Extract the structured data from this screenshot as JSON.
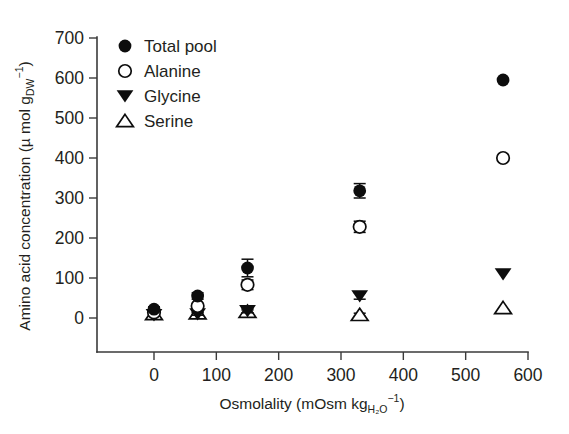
{
  "figure": {
    "title": "",
    "background": "#ffffff",
    "marker_color": "#0d0d0d",
    "axis_color": "#3a3a3a"
  },
  "axes": {
    "y": {
      "label_parts": {
        "main": "Amino acid concentration (µ mol g",
        "sub": "DW",
        "sup": "−1",
        "tail": ")"
      },
      "label_plain": "Amino acid concentration (µ mol g_DW^−1)",
      "ticks": [
        "0",
        "100",
        "200",
        "300",
        "400",
        "500",
        "600",
        "700"
      ],
      "min": 0,
      "max": 700
    },
    "x": {
      "label_parts": {
        "main": "Osmolality (mOsm kg",
        "sub": "H₂O",
        "sup": "−1",
        "tail": ")"
      },
      "label_plain": "Osmolality (mOsm kg_H2O^−1)",
      "ticks": [
        "0",
        "100",
        "200",
        "300",
        "400",
        "500",
        "600"
      ],
      "min": 0,
      "max": 600
    }
  },
  "legend": {
    "position": "top-left-inside",
    "items": [
      {
        "label": "Total pool",
        "marker": "filled-circle"
      },
      {
        "label": "Alanine",
        "marker": "open-circle"
      },
      {
        "label": "Glycine",
        "marker": "filled-triangle-down"
      },
      {
        "label": "Serine",
        "marker": "open-triangle-up"
      }
    ]
  },
  "chart_data": {
    "type": "scatter",
    "title": "",
    "xlabel": "Osmolality (mOsm kg_H2O^−1)",
    "ylabel": "Amino acid concentration (µ mol g_DW^−1)",
    "xlim": [
      0,
      600
    ],
    "ylim": [
      0,
      700
    ],
    "grid": false,
    "legend_position": "upper left",
    "x": [
      0,
      70,
      150,
      330,
      560
    ],
    "series": [
      {
        "name": "Total pool",
        "marker": "filled-circle",
        "values": [
          22,
          55,
          125,
          318,
          595
        ],
        "errors": [
          6,
          8,
          22,
          18,
          0
        ]
      },
      {
        "name": "Alanine",
        "marker": "open-circle",
        "values": [
          14,
          30,
          83,
          228,
          400
        ],
        "errors": [
          5,
          6,
          12,
          14,
          0
        ]
      },
      {
        "name": "Glycine",
        "marker": "filled-triangle-down",
        "values": [
          8,
          10,
          18,
          55,
          110
        ],
        "errors": [
          3,
          3,
          5,
          8,
          0
        ]
      },
      {
        "name": "Serine",
        "marker": "open-triangle-up",
        "values": [
          10,
          12,
          16,
          8,
          25
        ],
        "errors": [
          3,
          3,
          4,
          4,
          0
        ]
      }
    ]
  }
}
